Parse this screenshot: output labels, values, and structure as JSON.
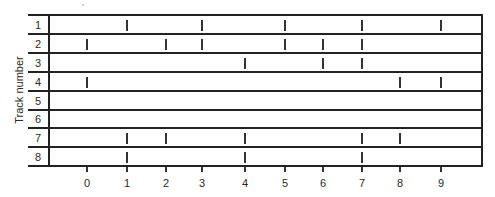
{
  "figure": {
    "ylabel": "Track number",
    "x_ticks": [
      "0",
      "1",
      "2",
      "3",
      "4",
      "5",
      "6",
      "7",
      "8",
      "9"
    ],
    "x_tick_px": [
      87,
      127,
      166,
      202,
      245,
      285,
      323,
      362,
      400,
      441
    ],
    "tracks": [
      {
        "label": "1",
        "marks": [
          1,
          3,
          5,
          7,
          9
        ]
      },
      {
        "label": "2",
        "marks": [
          0,
          2,
          3,
          5,
          6,
          7
        ]
      },
      {
        "label": "3",
        "marks": [
          4,
          6,
          7
        ]
      },
      {
        "label": "4",
        "marks": [
          0,
          8,
          9
        ]
      },
      {
        "label": "5",
        "marks": []
      },
      {
        "label": "6",
        "marks": []
      },
      {
        "label": "7",
        "marks": [
          1,
          2,
          4,
          7,
          8
        ]
      },
      {
        "label": "8",
        "marks": [
          1,
          4,
          7
        ]
      }
    ],
    "row_lines_px": [
      14,
      33,
      52,
      71,
      90,
      109,
      127,
      146,
      165
    ]
  }
}
